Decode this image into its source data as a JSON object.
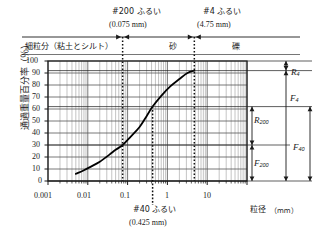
{
  "chart_data": {
    "type": "line",
    "title": "",
    "xlabel": "粒径（mm）",
    "ylabel": "通過重量百分率（％）",
    "xscale": "log",
    "xlim": [
      0.001,
      100
    ],
    "ylim": [
      0,
      100
    ],
    "grid": true,
    "legend": "none",
    "x_ticks": [
      "0.001",
      "0.01",
      "0.1",
      "1",
      "10"
    ],
    "y_ticks": [
      "0",
      "10",
      "20",
      "30",
      "40",
      "50",
      "60",
      "70",
      "80",
      "90",
      "100"
    ],
    "series": [
      {
        "name": "粒径加積曲線",
        "x": [
          0.005,
          0.008,
          0.012,
          0.02,
          0.035,
          0.05,
          0.075,
          0.12,
          0.2,
          0.3,
          0.425,
          0.7,
          1.2,
          2.0,
          3.2,
          4.75
        ],
        "y": [
          6,
          9,
          12,
          16,
          22,
          26,
          30,
          37,
          45,
          54,
          62,
          71,
          79,
          85,
          90,
          92
        ]
      }
    ],
    "annotations": [
      {
        "id": "sieve200",
        "value": 0.075,
        "percent_passing": 30,
        "label": "#200 ふるい",
        "sublabel": "(0.075 mm)"
      },
      {
        "id": "sieve40",
        "value": 0.425,
        "percent_passing": 62,
        "label": "#40 ふるい",
        "sublabel": "(0.425 mm)"
      },
      {
        "id": "sieve4",
        "value": 4.75,
        "percent_passing": 92,
        "label": "#4 ふるい",
        "sublabel": "(4.75 mm)"
      }
    ],
    "zones": [
      {
        "id": "fines",
        "label": "細粒分（粘土とシルト）",
        "from": 0.001,
        "to": 0.075
      },
      {
        "id": "sand",
        "label": "砂",
        "from": 0.075,
        "to": 4.75
      },
      {
        "id": "gravel",
        "label": "礫",
        "from": 4.75,
        "to": 100
      }
    ],
    "fractions": [
      {
        "id": "R4",
        "symbol": "R",
        "subscript": "4",
        "from_percent": 92,
        "to_percent": 100,
        "value": 8,
        "meaning": "礫分（#4 ふるい残留分）"
      },
      {
        "id": "F4",
        "symbol": "F",
        "subscript": "4",
        "from_percent": 0,
        "to_percent": 92,
        "value": 92,
        "meaning": "#4 ふるい通過分"
      },
      {
        "id": "R200",
        "symbol": "R",
        "subscript": "200",
        "from_percent": 30,
        "to_percent": 62,
        "value": 32,
        "meaning": "#200 ふるい残留分"
      },
      {
        "id": "F200",
        "symbol": "F",
        "subscript": "200",
        "from_percent": 0,
        "to_percent": 30,
        "value": 30,
        "meaning": "#200 ふるい通過分"
      },
      {
        "id": "F40",
        "symbol": "F",
        "subscript": "40",
        "from_percent": 0,
        "to_percent": 62,
        "value": 62,
        "meaning": "#40 ふるい通過分"
      }
    ]
  },
  "labels": {
    "y_axis": "通過重量百分率（％）",
    "x_axis_name": "粒径",
    "x_axis_unit": "（mm）",
    "zone_fines": "細粒分（粘土とシルト）",
    "zone_sand": "砂",
    "zone_gravel": "礫",
    "sieve200_title": "#200 ふるい",
    "sieve200_size": "(0.075 mm)",
    "sieve4_title": "#4 ふるい",
    "sieve4_size": "(4.75 mm)",
    "sieve40_title": "#40 ふるい",
    "sieve40_size": "(0.425 mm)",
    "tick_x_1": "0.001",
    "tick_x_2": "0.01",
    "tick_x_3": "0.1",
    "tick_x_4": "1",
    "tick_x_5": "10",
    "tick_y_0": "0",
    "tick_y_10": "10",
    "tick_y_20": "20",
    "tick_y_30": "30",
    "tick_y_40": "40",
    "tick_y_50": "50",
    "tick_y_60": "60",
    "tick_y_70": "70",
    "tick_y_80": "80",
    "tick_y_90": "90",
    "tick_y_100": "100",
    "frac_R4": "R",
    "frac_R4_sub": "4",
    "frac_F4": "F",
    "frac_F4_sub": "4",
    "frac_R200": "R",
    "frac_R200_sub": "200",
    "frac_F200": "F",
    "frac_F200_sub": "200",
    "frac_F40": "F",
    "frac_F40_sub": "40"
  },
  "colors": {
    "background": "#ffffff",
    "axis": "#1a1a1a",
    "grid_major": "#555555",
    "grid_minor": "#888888",
    "curve": "#000000",
    "dotted": "#111111"
  }
}
